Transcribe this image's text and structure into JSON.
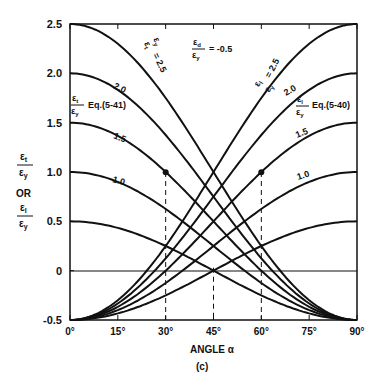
{
  "chart_data": {
    "type": "line",
    "title": "",
    "caption": "(c)",
    "xlabel": "ANGLE α",
    "ylabel_top": "εt/εy",
    "ylabel_or": "OR",
    "ylabel_bottom": "εl/εy",
    "x_ticks": [
      "0°",
      "15°",
      "30°",
      "45°",
      "60°",
      "75°",
      "90°"
    ],
    "x_tick_values": [
      0,
      15,
      30,
      45,
      60,
      75,
      90
    ],
    "y_ticks": [
      "-0.5",
      "0",
      "0.5",
      "1.0",
      "1.5",
      "2.0",
      "2.5"
    ],
    "y_tick_values": [
      -0.5,
      0,
      0.5,
      1.0,
      1.5,
      2.0,
      2.5
    ],
    "xlim": [
      0,
      90
    ],
    "ylim": [
      -0.5,
      2.5
    ],
    "grid": false,
    "parameter_label": "εd/εy = -0.5",
    "series_descending_label": "εt/εy Eq.(5-41)",
    "series_ascending_label": "εl/εy Eq.(5-40)",
    "series": [
      {
        "name": "εt/εy, εl/εy = 2.5 (descending)",
        "x": [
          0,
          15,
          30,
          45,
          60,
          75,
          90
        ],
        "values": [
          2.5,
          2.3,
          1.75,
          1.0,
          0.25,
          -0.3,
          -0.5
        ]
      },
      {
        "name": "2.0 (descending)",
        "x": [
          0,
          15,
          30,
          45,
          60,
          75,
          90
        ],
        "values": [
          2.0,
          1.83,
          1.38,
          0.75,
          0.13,
          -0.33,
          -0.5
        ]
      },
      {
        "name": "1.5 (descending)",
        "x": [
          0,
          15,
          30,
          45,
          60,
          75,
          90
        ],
        "values": [
          1.5,
          1.37,
          1.0,
          0.5,
          0.0,
          -0.37,
          -0.5
        ]
      },
      {
        "name": "1.0 (descending)",
        "x": [
          0,
          15,
          30,
          45,
          60,
          75,
          90
        ],
        "values": [
          1.0,
          0.9,
          0.63,
          0.25,
          -0.13,
          -0.4,
          -0.5
        ]
      },
      {
        "name": "0.5 (descending)",
        "x": [
          0,
          15,
          30,
          45,
          60,
          75,
          90
        ],
        "values": [
          0.5,
          0.43,
          0.25,
          0.0,
          -0.25,
          -0.43,
          -0.5
        ]
      },
      {
        "name": "2.5 (ascending)",
        "x": [
          0,
          15,
          30,
          45,
          60,
          75,
          90
        ],
        "values": [
          -0.5,
          -0.3,
          0.25,
          1.0,
          1.75,
          2.3,
          2.5
        ]
      },
      {
        "name": "2.0 (ascending)",
        "x": [
          0,
          15,
          30,
          45,
          60,
          75,
          90
        ],
        "values": [
          -0.5,
          -0.33,
          0.13,
          0.75,
          1.38,
          1.83,
          2.0
        ]
      },
      {
        "name": "1.5 (ascending)",
        "x": [
          0,
          15,
          30,
          45,
          60,
          75,
          90
        ],
        "values": [
          -0.5,
          -0.37,
          0.0,
          0.5,
          1.0,
          1.37,
          1.5
        ]
      },
      {
        "name": "1.0 (ascending)",
        "x": [
          0,
          15,
          30,
          45,
          60,
          75,
          90
        ],
        "values": [
          -0.5,
          -0.4,
          -0.13,
          0.25,
          0.63,
          0.9,
          1.0
        ]
      },
      {
        "name": "0.5 (ascending)",
        "x": [
          0,
          15,
          30,
          45,
          60,
          75,
          90
        ],
        "values": [
          -0.5,
          -0.43,
          -0.25,
          0.0,
          0.25,
          0.43,
          0.5
        ]
      }
    ],
    "curve_labels": [
      "2.5",
      "2.0",
      "1.5",
      "1.0"
    ],
    "annotations": [
      {
        "type": "point",
        "x": 30,
        "y": 1.0
      },
      {
        "type": "point",
        "x": 60,
        "y": 1.0
      },
      {
        "type": "dashed-vline",
        "x": 30
      },
      {
        "type": "dashed-vline",
        "x": 45
      },
      {
        "type": "dashed-vline",
        "x": 60
      }
    ]
  }
}
